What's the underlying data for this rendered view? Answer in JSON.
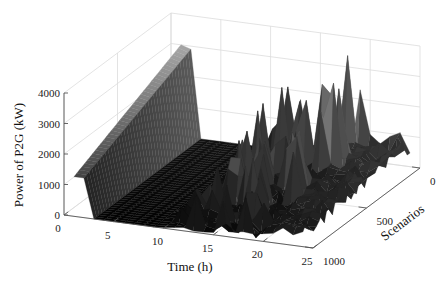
{
  "chart_data": {
    "type": "surface3d",
    "title": "",
    "xlabel": "Time (h)",
    "ylabel": "Scenarios",
    "zlabel": "Power of P2G (kW)",
    "xlim": [
      0,
      25
    ],
    "ylim": [
      0,
      1000
    ],
    "zlim": [
      0,
      4000
    ],
    "xticks": [
      0,
      5,
      10,
      15,
      20,
      25
    ],
    "yticks": [
      0,
      500,
      1000
    ],
    "zticks": [
      0,
      1000,
      2000,
      3000,
      4000
    ],
    "xtick_labels": [
      "0",
      "5",
      "10",
      "15",
      "20",
      "25"
    ],
    "ytick_labels": [
      "0",
      "500",
      "1000"
    ],
    "ztick_labels": [
      "0",
      "1000",
      "2000",
      "3000",
      "4000"
    ],
    "grid": true,
    "colormap": "gray",
    "time_hours": [
      1,
      2,
      3,
      4,
      5,
      6,
      7,
      8,
      9,
      10,
      11,
      12,
      13,
      14,
      15,
      16,
      17,
      18,
      19,
      20,
      21,
      22,
      23,
      24
    ],
    "description_of_surface": "Hours 1-2: plateau near 1300-3000 kW sloping toward scenario 0; hours 3-10: near 0; hours 10-20: many sharp spikes up to ~3800 kW; hours 20-24: low ridge ~500-1100 kW",
    "peak_series": [
      {
        "name": "approx max power across scenarios",
        "values": [
          3000,
          2900,
          0,
          0,
          0,
          0,
          0,
          0,
          0,
          300,
          1500,
          2200,
          3200,
          2700,
          3000,
          3400,
          2800,
          3500,
          3900,
          900,
          900,
          1000,
          1100,
          1100
        ]
      }
    ]
  }
}
